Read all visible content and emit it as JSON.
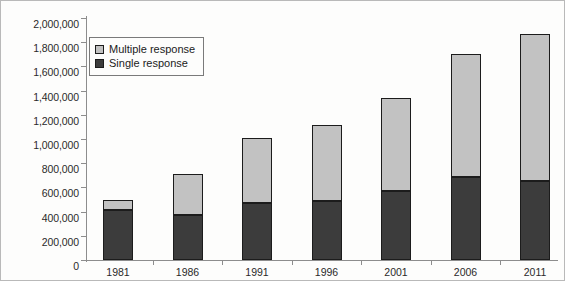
{
  "chart_data": {
    "type": "bar",
    "stacked": true,
    "title": "",
    "subtitle": "",
    "xlabel": "",
    "ylabel": "",
    "categories": [
      "1981",
      "1986",
      "1991",
      "1996",
      "2001",
      "2006",
      "2011"
    ],
    "series": [
      {
        "name": "Single response",
        "color": "#3c3c3c",
        "values": [
          415000,
          375000,
          470000,
          485000,
          570000,
          685000,
          650000
        ]
      },
      {
        "name": "Multiple response",
        "color": "#c2c2c2",
        "values": [
          80000,
          335000,
          540000,
          630000,
          770000,
          1015000,
          1215000
        ]
      }
    ],
    "totals": [
      495000,
      710000,
      1010000,
      1115000,
      1340000,
      1700000,
      1865000
    ],
    "ylim": [
      0,
      2000000
    ],
    "ytick_step": 200000,
    "ytick_labels": [
      "0",
      "200,000",
      "400,000",
      "600,000",
      "800,000",
      "1,000,000",
      "1,200,000",
      "1,400,000",
      "1,600,000",
      "1,800,000",
      "2,000,000"
    ],
    "ytick_values": [
      0,
      200000,
      400000,
      600000,
      800000,
      1000000,
      1200000,
      1400000,
      1600000,
      1800000,
      2000000
    ],
    "grid": false,
    "legend_position": "top-left",
    "legend_entries": [
      {
        "label": "Multiple response",
        "color": "#c2c2c2"
      },
      {
        "label": "Single response",
        "color": "#3c3c3c"
      }
    ]
  },
  "legend": {
    "multiple_label": "Multiple response",
    "single_label": "Single response"
  },
  "colors": {
    "multiple_response": "#c2c2c2",
    "single_response": "#3c3c3c",
    "axis": "#8d8d8d",
    "outline": "#1c1c1c",
    "background": "#fdfdfc"
  }
}
